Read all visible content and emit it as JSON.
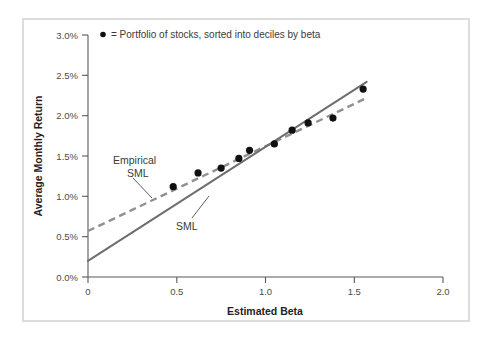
{
  "figure": {
    "background_color": "#ffffff",
    "frame_color": "#dcdcdc"
  },
  "legend": {
    "marker": "filled-circle",
    "text": "= Portfolio of stocks, sorted into deciles by beta"
  },
  "annotations": {
    "empirical_line1": "Empirical",
    "empirical_line2": "SML",
    "sml": "SML"
  },
  "chart_data": {
    "type": "scatter",
    "title": "",
    "xlabel": "Estimated Beta",
    "ylabel": "Average Monthly Return",
    "xlim": [
      0,
      2.0
    ],
    "ylim": [
      0,
      3.0
    ],
    "grid": false,
    "legend_position": "top-left-inside",
    "xticks": [
      0,
      0.5,
      1.0,
      1.5,
      2.0
    ],
    "xticklabels": [
      "0",
      "0.5",
      "1.0",
      "1.5",
      "2.0"
    ],
    "yticks": [
      0.0,
      0.5,
      1.0,
      1.5,
      2.0,
      2.5,
      3.0
    ],
    "yticklabels": [
      "0.0%",
      "0.5%",
      "1.0%",
      "1.5%",
      "2.0%",
      "2.5%",
      "3.0%"
    ],
    "series": [
      {
        "name": "Portfolio of stocks, sorted into deciles by beta",
        "type": "scatter",
        "marker": "o",
        "color": "#101010",
        "x": [
          0.48,
          0.62,
          0.75,
          0.85,
          0.91,
          1.05,
          1.15,
          1.24,
          1.38,
          1.55
        ],
        "y": [
          1.12,
          1.29,
          1.35,
          1.47,
          1.57,
          1.65,
          1.82,
          1.91,
          1.97,
          2.33
        ]
      },
      {
        "name": "SML",
        "type": "line",
        "style": "solid",
        "color": "#6d6e72",
        "intercept": 0.2,
        "slope": 1.414,
        "x": [
          0,
          1.57
        ],
        "y": [
          0.2,
          2.42
        ]
      },
      {
        "name": "Empirical SML",
        "type": "line",
        "style": "dashed",
        "color": "#8f9094",
        "intercept": 0.57,
        "slope": 1.051,
        "x": [
          0,
          1.57
        ],
        "y": [
          0.57,
          2.22
        ]
      }
    ]
  }
}
